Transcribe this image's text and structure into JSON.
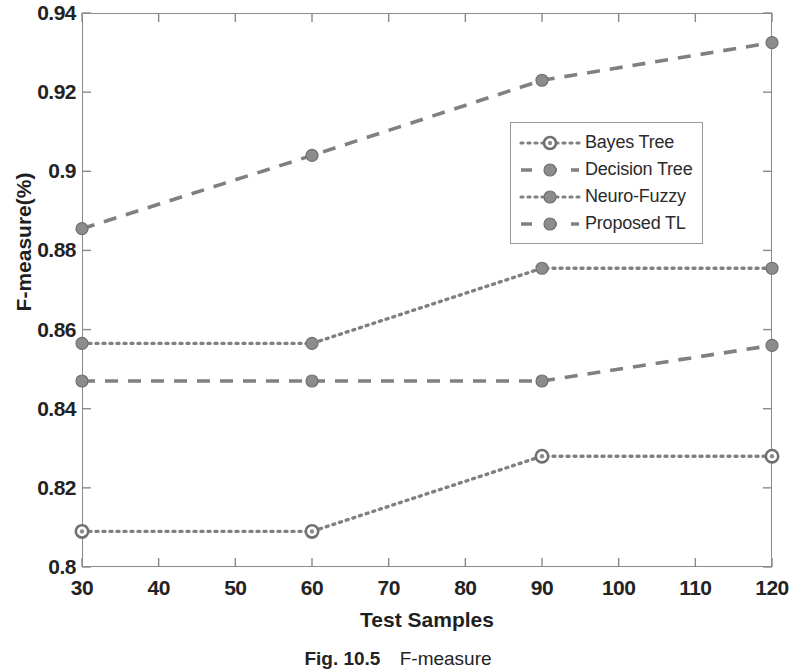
{
  "figure": {
    "caption_number": "Fig. 10.5",
    "caption_text": "F-measure"
  },
  "colors": {
    "line": "#808080",
    "marker_fill": "#8c8c8c",
    "marker_edge": "#707070",
    "axis": "#8a8a8a",
    "text": "#232323",
    "background": "#ffffff"
  },
  "chart_data": {
    "type": "line",
    "title": "",
    "xlabel": "Test Samples",
    "ylabel": "F-measure(%)",
    "x": [
      30,
      60,
      90,
      120
    ],
    "xlim": [
      30,
      120
    ],
    "ylim": [
      0.8,
      0.94
    ],
    "xticks": [
      30,
      40,
      50,
      60,
      70,
      80,
      90,
      100,
      110,
      120
    ],
    "xticklabels": [
      "30",
      "40",
      "50",
      "60",
      "70",
      "80",
      "90",
      "100",
      "110",
      "120"
    ],
    "yticks": [
      0.8,
      0.82,
      0.84,
      0.86,
      0.88,
      0.9,
      0.92,
      0.94
    ],
    "yticklabels": [
      "0.8",
      "0.82",
      "0.84",
      "0.86",
      "0.88",
      "0.9",
      "0.92",
      "0.94"
    ],
    "grid": false,
    "legend_position": "center-right",
    "series": [
      {
        "name": "Bayes Tree",
        "values": [
          0.809,
          0.809,
          0.828,
          0.828
        ],
        "linestyle": "dotted",
        "marker": "open-circle"
      },
      {
        "name": "Decision Tree",
        "values": [
          0.847,
          0.847,
          0.847,
          0.856
        ],
        "linestyle": "dashed",
        "marker": "filled-circle"
      },
      {
        "name": "Neuro-Fuzzy",
        "values": [
          0.8565,
          0.8565,
          0.8755,
          0.8755
        ],
        "linestyle": "dotted",
        "marker": "filled-circle"
      },
      {
        "name": "Proposed TL",
        "values": [
          0.8855,
          0.904,
          0.923,
          0.9325
        ],
        "linestyle": "dashed",
        "marker": "filled-circle"
      }
    ]
  }
}
